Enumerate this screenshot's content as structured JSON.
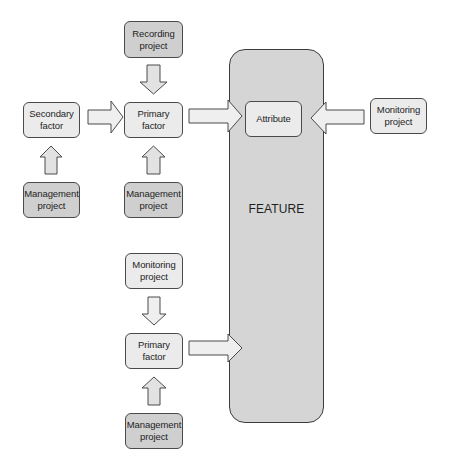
{
  "diagram": {
    "feature": {
      "label": "FEATURE",
      "fill": "#d5d5d5"
    },
    "nodes": {
      "recording_project": {
        "label": "Recording\nproject",
        "fill": "#cfcfcf"
      },
      "secondary_factor": {
        "label": "Secondary\nfactor",
        "fill": "#ebebeb"
      },
      "primary_factor_top": {
        "label": "Primary\nfactor",
        "fill": "#ebebeb"
      },
      "management_project_left": {
        "label": "Management\nproject",
        "fill": "#cfcfcf"
      },
      "management_project_mid": {
        "label": "Management\nproject",
        "fill": "#cfcfcf"
      },
      "attribute": {
        "label": "Attribute",
        "fill": "#ebebeb"
      },
      "monitoring_project_right": {
        "label": "Monitoring\nproject",
        "fill": "#ebebeb"
      },
      "monitoring_project_bottom": {
        "label": "Monitoring\nproject",
        "fill": "#ebebeb"
      },
      "primary_factor_bottom": {
        "label": "Primary\nfactor",
        "fill": "#ebebeb"
      },
      "management_project_bottom": {
        "label": "Management\nproject",
        "fill": "#cfcfcf"
      }
    },
    "edges": [
      {
        "from": "recording_project",
        "to": "primary_factor_top",
        "direction": "down"
      },
      {
        "from": "secondary_factor",
        "to": "primary_factor_top",
        "direction": "right"
      },
      {
        "from": "management_project_left",
        "to": "secondary_factor",
        "direction": "up"
      },
      {
        "from": "management_project_mid",
        "to": "primary_factor_top",
        "direction": "up"
      },
      {
        "from": "primary_factor_top",
        "to": "attribute",
        "direction": "right"
      },
      {
        "from": "monitoring_project_right",
        "to": "attribute",
        "direction": "left"
      },
      {
        "from": "monitoring_project_bottom",
        "to": "primary_factor_bottom",
        "direction": "down"
      },
      {
        "from": "management_project_bottom",
        "to": "primary_factor_bottom",
        "direction": "up"
      },
      {
        "from": "primary_factor_bottom",
        "to": "feature",
        "direction": "right"
      }
    ]
  }
}
